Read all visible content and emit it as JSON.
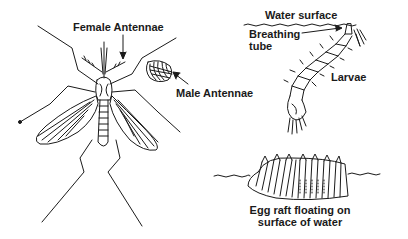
{
  "diagram": {
    "colors": {
      "ink": "#1a1a1a",
      "background": "#ffffff"
    },
    "labels": {
      "female_antennae": "Female Antennae",
      "male_antennae": "Male Antennae",
      "water_surface": "Water surface",
      "breathing_tube_line1": "Breathing",
      "breathing_tube_line2": "tube",
      "larvae": "Larvae",
      "egg_raft_line1": "Egg raft floating on",
      "egg_raft_line2": "surface of water"
    },
    "figures": [
      {
        "name": "adult-mosquito",
        "icon": "mosquito-icon"
      },
      {
        "name": "male-antenna-detail",
        "icon": "feathery-antenna-icon"
      },
      {
        "name": "larva",
        "icon": "larva-icon"
      },
      {
        "name": "egg-raft",
        "icon": "egg-raft-icon"
      }
    ]
  }
}
